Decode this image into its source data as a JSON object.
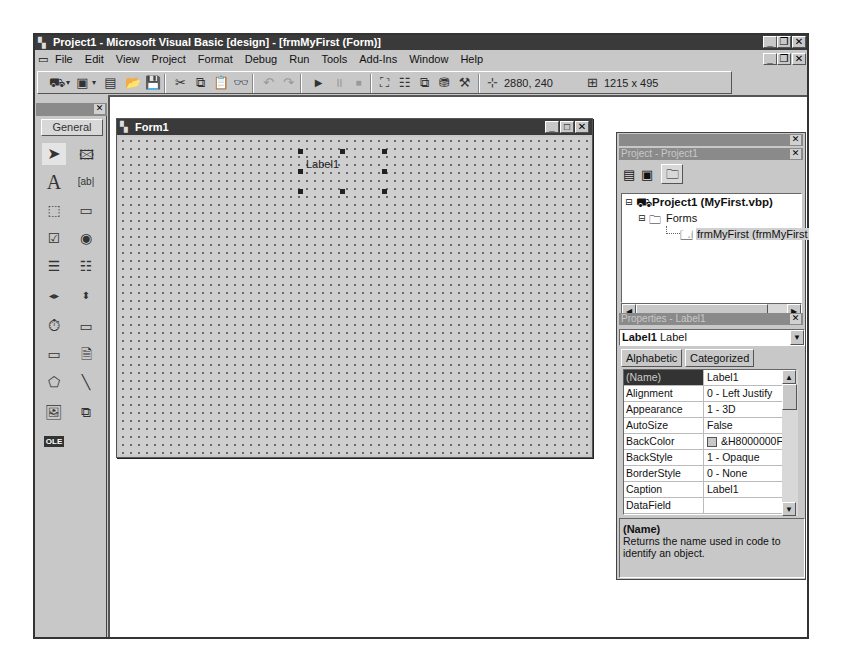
{
  "window": {
    "title": "Project1 - Microsoft Visual Basic [design] - [frmMyFirst (Form)]",
    "controls": {
      "minimize": "_",
      "restore": "❐",
      "close": "✕"
    }
  },
  "menubar": {
    "items": [
      {
        "label": "File"
      },
      {
        "label": "Edit"
      },
      {
        "label": "View"
      },
      {
        "label": "Project"
      },
      {
        "label": "Format"
      },
      {
        "label": "Debug"
      },
      {
        "label": "Run"
      },
      {
        "label": "Tools"
      },
      {
        "label": "Add-Ins"
      },
      {
        "label": "Window"
      },
      {
        "label": "Help"
      }
    ]
  },
  "toolbar": {
    "position": "2880, 240",
    "size": "1215 x 495",
    "buttons": [
      "add-project",
      "add-form",
      "menu-editor",
      "open-project",
      "save-project",
      "cut",
      "copy",
      "paste",
      "find",
      "undo",
      "redo",
      "start",
      "break",
      "end",
      "project-explorer",
      "properties-window",
      "form-layout",
      "object-browser",
      "toolbox"
    ]
  },
  "toolbox": {
    "tab_label": "General",
    "tools": [
      "Pointer",
      "PictureBox",
      "Label",
      "TextBox",
      "Frame",
      "CommandButton",
      "CheckBox",
      "OptionButton",
      "ComboBox",
      "ListBox",
      "HScrollBar",
      "VScrollBar",
      "Timer",
      "DriveListBox",
      "DirListBox",
      "FileListBox",
      "Shape",
      "Line",
      "Image",
      "Data",
      "OLE"
    ]
  },
  "form": {
    "title": "Form1",
    "label_control": "Label1"
  },
  "project_explorer": {
    "title": "Project - Project1",
    "tree": {
      "project": "Project1 (MyFirst.vbp)",
      "folder": "Forms",
      "item": "frmMyFirst (frmMyFirst"
    }
  },
  "properties": {
    "title": "Properties - Label1",
    "object_name": "Label1",
    "object_type": "Label",
    "tabs": [
      "Alphabetic",
      "Categorized"
    ],
    "active_tab": "Alphabetic",
    "rows": [
      {
        "name": "(Name)",
        "value": "Label1"
      },
      {
        "name": "Alignment",
        "value": "0 - Left Justify"
      },
      {
        "name": "Appearance",
        "value": "1 - 3D"
      },
      {
        "name": "AutoSize",
        "value": "False"
      },
      {
        "name": "BackColor",
        "value": "&H8000000F"
      },
      {
        "name": "BackStyle",
        "value": "1 - Opaque"
      },
      {
        "name": "BorderStyle",
        "value": "0 - None"
      },
      {
        "name": "Caption",
        "value": "Label1"
      },
      {
        "name": "DataField",
        "value": ""
      }
    ],
    "description": {
      "heading": "(Name)",
      "text": "Returns the name used in code to identify an object."
    }
  }
}
